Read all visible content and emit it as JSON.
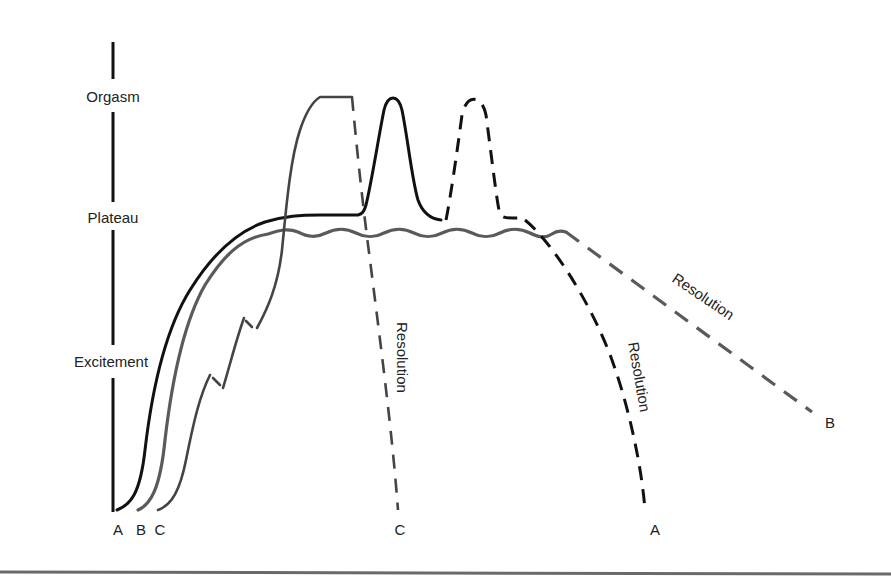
{
  "diagram": {
    "title": "",
    "axis_labels": {
      "orgasm": "Orgasm",
      "plateau": "Plateau",
      "excitement": "Excitement"
    },
    "start_labels": [
      "A",
      "B",
      "C"
    ],
    "end_labels": {
      "c": "C",
      "a": "A",
      "b": "B"
    },
    "phase_annotations": {
      "resolution_c": "Resolution",
      "resolution_a": "Resolution",
      "resolution_b": "Resolution"
    },
    "curves": [
      {
        "id": "A",
        "style": "solid black then dashed",
        "color": "#111111",
        "description": "Rises to plateau, two orgasm peaks (second dashed), then dashed resolution to baseline"
      },
      {
        "id": "B",
        "style": "wavy gray then dashed",
        "color": "#5a5a5a",
        "description": "Rises to wavy plateau with no orgasm, then slow dashed resolution"
      },
      {
        "id": "C",
        "style": "stepwise gray then dashed",
        "color": "#444444",
        "description": "Stepwise excitement rising directly to a sustained orgasm, then rapid dashed resolution"
      }
    ]
  }
}
